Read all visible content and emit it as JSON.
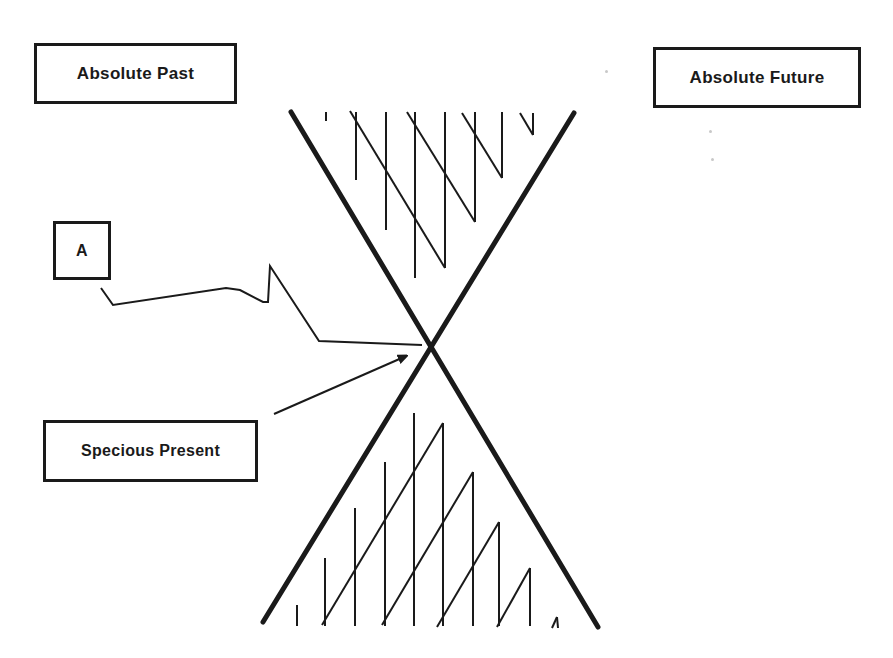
{
  "diagram": {
    "labels": {
      "absolute_past": "Absolute Past",
      "absolute_future": "Absolute Future",
      "point_a": "A",
      "specious_present": "Specious Present"
    },
    "colors": {
      "ink": "#1a1a1a",
      "background": "#ffffff",
      "speck": "#c8c8c8"
    },
    "cone_lines": [
      {
        "name": "past-to-future-edge",
        "x1": 291,
        "y1": 112,
        "x2": 598,
        "y2": 627,
        "width": 5
      },
      {
        "name": "future-to-past-edge",
        "x1": 574,
        "y1": 113,
        "x2": 263,
        "y2": 622,
        "width": 5
      }
    ],
    "vertex": {
      "x": 432,
      "y": 345
    },
    "connector_a_path": [
      [
        101,
        288
      ],
      [
        113,
        305
      ],
      [
        226,
        288
      ],
      [
        240,
        290
      ],
      [
        263,
        302
      ],
      [
        268,
        302
      ],
      [
        270,
        266
      ],
      [
        319,
        341
      ],
      [
        422,
        345
      ]
    ],
    "present_arrow": {
      "x1": 274,
      "y1": 414,
      "x2": 404,
      "y2": 357
    },
    "upper_hatch": {
      "verticals": [
        {
          "x": 326,
          "y1": 112,
          "y2": 121
        },
        {
          "x": 356,
          "y1": 112,
          "y2": 180
        },
        {
          "x": 386,
          "y1": 112,
          "y2": 230
        },
        {
          "x": 415,
          "y1": 112,
          "y2": 278
        },
        {
          "x": 445,
          "y1": 112,
          "y2": 268
        },
        {
          "x": 475,
          "y1": 112,
          "y2": 222
        },
        {
          "x": 502,
          "y1": 112,
          "y2": 178
        },
        {
          "x": 533,
          "y1": 113,
          "y2": 135
        }
      ],
      "diagonals": [
        {
          "x1": 350,
          "y1": 111,
          "x2": 445,
          "y2": 268
        },
        {
          "x1": 407,
          "y1": 112,
          "x2": 475,
          "y2": 222
        },
        {
          "x1": 462,
          "y1": 113,
          "x2": 502,
          "y2": 178
        },
        {
          "x1": 520,
          "y1": 113,
          "x2": 533,
          "y2": 135
        }
      ]
    },
    "lower_hatch": {
      "verticals": [
        {
          "x": 297,
          "y1": 605,
          "y2": 626
        },
        {
          "x": 325,
          "y1": 558,
          "y2": 626
        },
        {
          "x": 355,
          "y1": 508,
          "y2": 626
        },
        {
          "x": 385,
          "y1": 462,
          "y2": 626
        },
        {
          "x": 414,
          "y1": 413,
          "y2": 626
        },
        {
          "x": 443,
          "y1": 423,
          "y2": 626
        },
        {
          "x": 473,
          "y1": 472,
          "y2": 626
        },
        {
          "x": 499,
          "y1": 522,
          "y2": 626
        },
        {
          "x": 530,
          "y1": 568,
          "y2": 626
        }
      ],
      "diagonals": [
        {
          "x1": 322,
          "y1": 625,
          "x2": 443,
          "y2": 423
        },
        {
          "x1": 382,
          "y1": 625,
          "x2": 473,
          "y2": 472
        },
        {
          "x1": 437,
          "y1": 627,
          "x2": 499,
          "y2": 522
        },
        {
          "x1": 497,
          "y1": 627,
          "x2": 530,
          "y2": 568
        },
        {
          "x1": 552,
          "y1": 628,
          "x2": 557,
          "y2": 617
        },
        {
          "x1": 557,
          "y1": 617,
          "x2": 558,
          "y2": 628
        }
      ]
    }
  }
}
